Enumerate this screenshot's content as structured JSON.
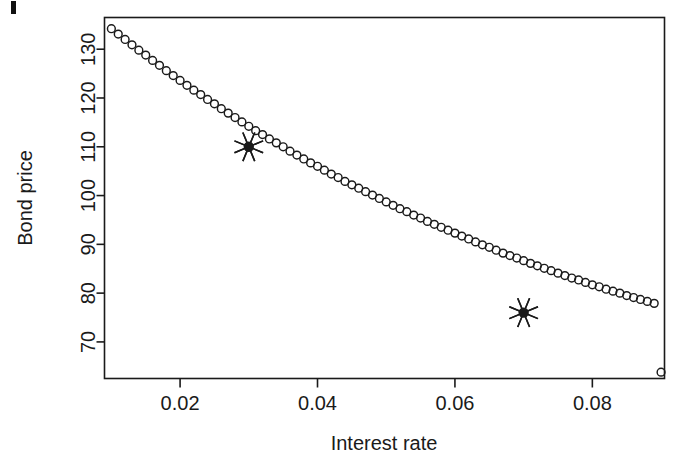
{
  "chart_data": {
    "type": "scatter",
    "title": "",
    "xlabel": "Interest rate",
    "ylabel": "Bond price",
    "xlim": [
      0.009,
      0.0905
    ],
    "ylim": [
      62.5,
      136.5
    ],
    "xticks": [
      0.02,
      0.04,
      0.06,
      0.08
    ],
    "xtick_labels": [
      "0.02",
      "0.04",
      "0.06",
      "0.08"
    ],
    "yticks": [
      70,
      80,
      90,
      100,
      110,
      120,
      130
    ],
    "ytick_labels": [
      "70",
      "80",
      "90",
      "100",
      "110",
      "120",
      "130"
    ],
    "grid": false,
    "legend": null,
    "marker": "open-circle",
    "series": [
      {
        "name": "Bond price curve",
        "marker": "open-circle",
        "x": [
          0.01,
          0.011,
          0.012,
          0.013,
          0.014,
          0.015,
          0.016,
          0.017,
          0.018,
          0.019,
          0.02,
          0.021,
          0.022,
          0.023,
          0.024,
          0.025,
          0.026,
          0.027,
          0.028,
          0.029,
          0.03,
          0.031,
          0.032,
          0.033,
          0.034,
          0.035,
          0.036,
          0.037,
          0.038,
          0.039,
          0.04,
          0.041,
          0.042,
          0.043,
          0.044,
          0.045,
          0.046,
          0.047,
          0.048,
          0.049,
          0.05,
          0.051,
          0.052,
          0.053,
          0.054,
          0.055,
          0.056,
          0.057,
          0.058,
          0.059,
          0.06,
          0.061,
          0.062,
          0.063,
          0.064,
          0.065,
          0.066,
          0.067,
          0.068,
          0.069,
          0.07,
          0.071,
          0.072,
          0.073,
          0.074,
          0.075,
          0.076,
          0.077,
          0.078,
          0.079,
          0.08,
          0.081,
          0.082,
          0.083,
          0.084,
          0.085,
          0.086,
          0.087,
          0.088,
          0.089,
          0.09
        ],
        "y": [
          134.2,
          133.1,
          132.0,
          130.9,
          129.8,
          128.8,
          127.7,
          126.7,
          125.6,
          124.6,
          123.6,
          122.6,
          121.6,
          120.7,
          119.7,
          118.8,
          117.8,
          116.9,
          116.0,
          115.1,
          110.0,
          113.3,
          112.5,
          111.6,
          110.8,
          110.0,
          109.1,
          108.3,
          107.5,
          106.7,
          106.0,
          105.2,
          104.4,
          103.7,
          102.9,
          102.2,
          101.5,
          100.8,
          100.1,
          99.4,
          98.7,
          98.0,
          97.3,
          96.7,
          96.0,
          95.4,
          94.7,
          94.1,
          93.5,
          92.9,
          92.3,
          91.7,
          91.1,
          90.5,
          89.9,
          89.4,
          88.8,
          88.2,
          87.7,
          87.2,
          76.0,
          86.1,
          85.6,
          85.1,
          84.6,
          84.1,
          83.6,
          83.1,
          82.7,
          82.2,
          81.7,
          81.3,
          80.8,
          80.4,
          80.0,
          79.5,
          79.1,
          78.7,
          78.3,
          77.9,
          63.8
        ]
      }
    ],
    "annotations": [
      {
        "label": "highlighted-point-1",
        "marker": "asterisk-star",
        "x": 0.03,
        "y": 110
      },
      {
        "label": "highlighted-point-2",
        "marker": "asterisk-star",
        "x": 0.07,
        "y": 76
      }
    ],
    "axis_color": "#1a1a1a",
    "marker_color": "#1a1a1a",
    "background_color": "#ffffff"
  }
}
